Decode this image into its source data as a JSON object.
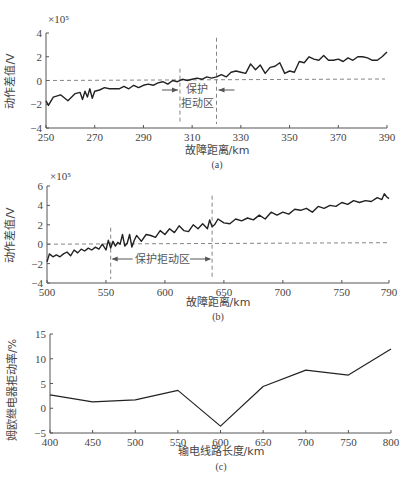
{
  "chart_data": [
    {
      "id": "a",
      "type": "line",
      "panel_label": "(a)",
      "title": "",
      "xlabel": "故障距离/km",
      "ylabel": "动作差值/V",
      "y_multiplier": "×10⁵",
      "xlim": [
        250,
        390
      ],
      "ylim": [
        -4,
        4
      ],
      "xticks": [
        250,
        270,
        290,
        310,
        330,
        350,
        370,
        390
      ],
      "yticks": [
        -4,
        -2,
        0,
        2,
        4
      ],
      "reference_line_y": 0,
      "zone": {
        "label_line1": "保护",
        "label_line2": "拒动区",
        "x_start": 305,
        "x_end": 320
      },
      "x": [
        250,
        251,
        253,
        256,
        259,
        262,
        264,
        265,
        266,
        267,
        268,
        269,
        270,
        272,
        274,
        276,
        278,
        280,
        282,
        284,
        286,
        288,
        290,
        292,
        294,
        296,
        298,
        300,
        302,
        304,
        306,
        308,
        310,
        312,
        314,
        316,
        318,
        320,
        322,
        324,
        326,
        328,
        330,
        332,
        334,
        336,
        338,
        340,
        342,
        344,
        346,
        348,
        350,
        352,
        354,
        356,
        358,
        360,
        362,
        364,
        366,
        368,
        370,
        372,
        374,
        376,
        378,
        380,
        382,
        384,
        386,
        388,
        390
      ],
      "values": [
        -1.7,
        -2.1,
        -1.4,
        -1.2,
        -1.7,
        -1.1,
        -1.0,
        -1.6,
        -0.9,
        -1.4,
        -0.7,
        -1.5,
        -0.9,
        -0.8,
        -0.6,
        -0.7,
        -0.7,
        -0.7,
        -0.5,
        -0.7,
        -0.4,
        -0.6,
        -0.4,
        -0.3,
        -0.4,
        -0.2,
        -0.1,
        -0.3,
        0.0,
        -0.1,
        0.1,
        0.0,
        0.1,
        0.2,
        0.1,
        0.3,
        0.2,
        0.3,
        0.5,
        0.3,
        0.7,
        0.8,
        0.7,
        0.6,
        1.4,
        0.9,
        1.3,
        0.6,
        1.1,
        1.2,
        1.5,
        0.6,
        0.8,
        0.7,
        1.6,
        1.5,
        2.0,
        1.8,
        1.7,
        2.1,
        1.7,
        1.7,
        1.8,
        1.6,
        1.9,
        1.7,
        2.0,
        2.0,
        1.9,
        1.7,
        1.7,
        2.0,
        2.4
      ]
    },
    {
      "id": "b",
      "type": "line",
      "panel_label": "(b)",
      "title": "",
      "xlabel": "故障距离/km",
      "ylabel": "动作差值/V",
      "y_multiplier": "×10⁵",
      "xlim": [
        500,
        790
      ],
      "ylim": [
        -4,
        6
      ],
      "xticks": [
        500,
        550,
        600,
        650,
        700,
        750,
        790
      ],
      "yticks": [
        -4,
        -2,
        0,
        2,
        4,
        6
      ],
      "reference_line_y": 0,
      "zone": {
        "label": "保护拒动区",
        "x_start": 554,
        "x_end": 640
      },
      "x": [
        500,
        502,
        505,
        508,
        511,
        514,
        517,
        520,
        523,
        526,
        529,
        532,
        535,
        538,
        541,
        544,
        547,
        550,
        552,
        554,
        556,
        558,
        560,
        562,
        564,
        566,
        568,
        570,
        572,
        574,
        576,
        578,
        580,
        584,
        588,
        592,
        596,
        600,
        604,
        608,
        612,
        616,
        620,
        624,
        628,
        632,
        636,
        638,
        640,
        642,
        645,
        650,
        655,
        660,
        665,
        670,
        675,
        680,
        685,
        690,
        695,
        700,
        705,
        710,
        715,
        720,
        725,
        730,
        735,
        740,
        745,
        750,
        755,
        760,
        765,
        770,
        775,
        780,
        784,
        786,
        788,
        790
      ],
      "values": [
        -1.8,
        -1.0,
        -1.3,
        -1.1,
        -1.3,
        -1.0,
        -0.8,
        -1.2,
        -0.6,
        -0.9,
        -0.5,
        -0.7,
        -0.4,
        -0.6,
        -0.3,
        -0.5,
        0.0,
        -0.6,
        0.4,
        -0.4,
        0.3,
        -0.2,
        0.2,
        0.0,
        1.0,
        -0.2,
        0.1,
        1.0,
        -0.3,
        0.4,
        0.9,
        0.6,
        0.3,
        1.0,
        0.9,
        0.7,
        1.4,
        1.0,
        1.6,
        1.2,
        1.9,
        1.4,
        1.3,
        2.0,
        1.6,
        2.1,
        1.6,
        2.5,
        1.8,
        2.0,
        2.6,
        2.2,
        2.1,
        2.6,
        2.4,
        2.7,
        2.5,
        3.0,
        2.6,
        3.3,
        3.0,
        3.3,
        3.1,
        3.6,
        3.5,
        3.7,
        3.3,
        3.9,
        3.7,
        4.0,
        3.9,
        4.3,
        4.1,
        4.5,
        4.3,
        4.5,
        4.4,
        4.8,
        4.6,
        5.2,
        4.9,
        4.7
      ]
    },
    {
      "id": "c",
      "type": "line",
      "panel_label": "(c)",
      "title": "",
      "xlabel": "输电线路长度/km",
      "ylabel": "姆欧继电器拒动率/%",
      "xlim": [
        400,
        800
      ],
      "ylim": [
        -5,
        15
      ],
      "xticks": [
        400,
        450,
        500,
        550,
        600,
        650,
        700,
        750,
        800
      ],
      "yticks": [
        -5,
        0,
        5,
        10,
        15
      ],
      "x": [
        400,
        450,
        500,
        550,
        600,
        650,
        700,
        750,
        800
      ],
      "values": [
        2.7,
        1.3,
        1.7,
        3.6,
        -3.6,
        4.4,
        7.7,
        6.7,
        12.0
      ]
    }
  ],
  "colors": {
    "line": "#222222",
    "axis": "#555555",
    "dashed": "#666666",
    "text": "#444444"
  }
}
